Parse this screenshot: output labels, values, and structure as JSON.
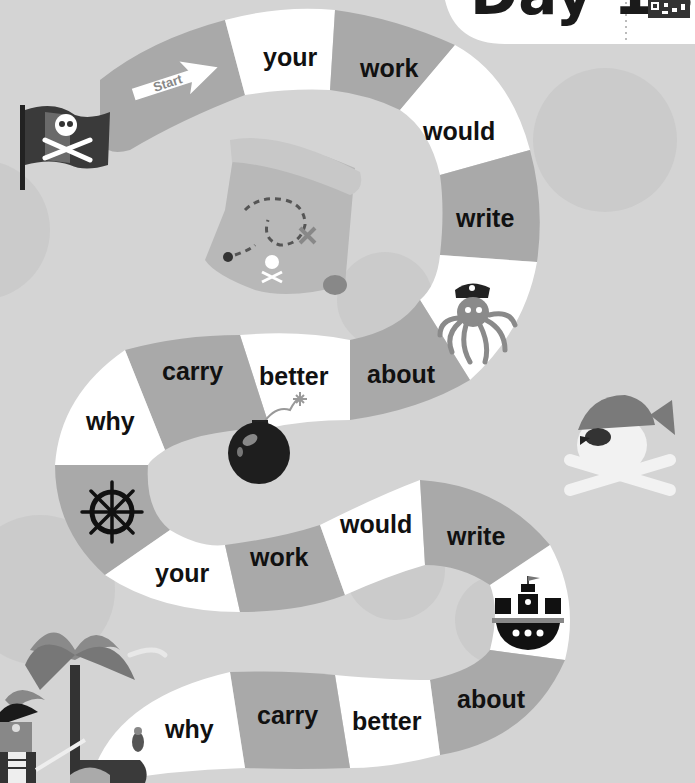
{
  "header": {
    "title": "Day 18",
    "qr_code": "qr-code"
  },
  "start": {
    "label": "Start"
  },
  "colors": {
    "background": "#d4d4d4",
    "path_dark": "#a9a9a9",
    "path_light": "#ffffff",
    "inner_ground": "#cfcfcf",
    "text": "#111111"
  },
  "board": {
    "spaces": [
      {
        "index": 1,
        "label": "your",
        "shade": "light"
      },
      {
        "index": 2,
        "label": "work",
        "shade": "dark"
      },
      {
        "index": 3,
        "label": "would",
        "shade": "light"
      },
      {
        "index": 4,
        "label": "write",
        "shade": "dark"
      },
      {
        "index": 5,
        "label": "",
        "icon": "octopus-pirate",
        "shade": "light"
      },
      {
        "index": 6,
        "label": "about",
        "shade": "dark"
      },
      {
        "index": 7,
        "label": "better",
        "shade": "light"
      },
      {
        "index": 8,
        "label": "carry",
        "shade": "dark"
      },
      {
        "index": 9,
        "label": "why",
        "shade": "light"
      },
      {
        "index": 10,
        "label": "",
        "icon": "ship-wheel",
        "shade": "dark"
      },
      {
        "index": 11,
        "label": "your",
        "shade": "light"
      },
      {
        "index": 12,
        "label": "work",
        "shade": "dark"
      },
      {
        "index": 13,
        "label": "would",
        "shade": "light"
      },
      {
        "index": 14,
        "label": "write",
        "shade": "dark"
      },
      {
        "index": 15,
        "label": "",
        "icon": "pirate-ship",
        "shade": "light"
      },
      {
        "index": 16,
        "label": "about",
        "shade": "dark"
      },
      {
        "index": 17,
        "label": "better",
        "shade": "light"
      },
      {
        "index": 18,
        "label": "carry",
        "shade": "dark"
      },
      {
        "index": 19,
        "label": "why",
        "shade": "light"
      }
    ]
  },
  "decorations": [
    "pirate-flag",
    "treasure-map",
    "bomb",
    "pirate-skull-bandana",
    "palm-trees",
    "pirate-captain",
    "parrot",
    "treasure-chest"
  ]
}
